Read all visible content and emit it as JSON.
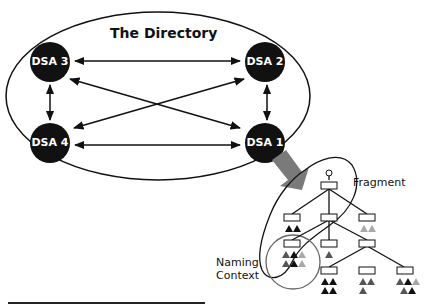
{
  "title": "The Directory",
  "nodes": [
    {
      "id": "dsa3",
      "label": "DSA 3"
    },
    {
      "id": "dsa2",
      "label": "DSA 2"
    },
    {
      "id": "dsa4",
      "label": "DSA 4"
    },
    {
      "id": "dsa1",
      "label": "DSA 1"
    }
  ],
  "connections": [
    [
      "DSA 3",
      "DSA 2"
    ],
    [
      "DSA 3",
      "DSA 4"
    ],
    [
      "DSA 3",
      "DSA 1"
    ],
    [
      "DSA 2",
      "DSA 1"
    ],
    [
      "DSA 2",
      "DSA 4"
    ],
    [
      "DSA 4",
      "DSA 1"
    ]
  ],
  "labels": {
    "fragment": "Fragment",
    "naming_context_line1": "Naming",
    "naming_context_line2": "Context"
  },
  "colors": {
    "node_fill": "#111111",
    "arrow_grey": "#7a7a7a",
    "triangle_dark": "#111111",
    "triangle_mid": "#555555",
    "triangle_light": "#a8a8a8",
    "naming_circle": "#666666"
  }
}
